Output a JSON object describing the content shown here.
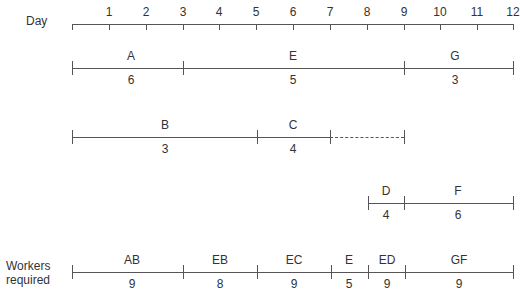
{
  "axis": {
    "label": "Day",
    "ticks": [
      "1",
      "2",
      "3",
      "4",
      "5",
      "6",
      "7",
      "8",
      "9",
      "10",
      "11",
      "12"
    ],
    "start": 0,
    "end": 12
  },
  "rows": [
    {
      "name": "row-aeg",
      "activities": [
        {
          "label": "A",
          "value": "6",
          "start": 0,
          "end": 3,
          "dashed": false
        },
        {
          "label": "E",
          "value": "5",
          "start": 3,
          "end": 9,
          "dashed": false
        },
        {
          "label": "G",
          "value": "3",
          "start": 9,
          "end": 12,
          "dashed": false
        }
      ]
    },
    {
      "name": "row-bc",
      "activities": [
        {
          "label": "B",
          "value": "3",
          "start": 0,
          "end": 5,
          "dashed": false
        },
        {
          "label": "C",
          "value": "4",
          "start": 5,
          "end": 7,
          "dashed": false
        },
        {
          "label": "",
          "value": "",
          "start": 7,
          "end": 9,
          "dashed": true
        }
      ]
    },
    {
      "name": "row-df",
      "activities": [
        {
          "label": "D",
          "value": "4",
          "start": 8,
          "end": 9,
          "dashed": false
        },
        {
          "label": "F",
          "value": "6",
          "start": 9,
          "end": 12,
          "dashed": false
        }
      ]
    }
  ],
  "workers": {
    "label_line1": "Workers",
    "label_line2": "required",
    "segments": [
      {
        "label": "AB",
        "value": "9",
        "start": 0,
        "end": 3
      },
      {
        "label": "EB",
        "value": "8",
        "start": 3,
        "end": 5
      },
      {
        "label": "EC",
        "value": "9",
        "start": 5,
        "end": 7
      },
      {
        "label": "E",
        "value": "5",
        "start": 7,
        "end": 8
      },
      {
        "label": "ED",
        "value": "9",
        "start": 8,
        "end": 9
      },
      {
        "label": "GF",
        "value": "9",
        "start": 9,
        "end": 12
      }
    ]
  }
}
